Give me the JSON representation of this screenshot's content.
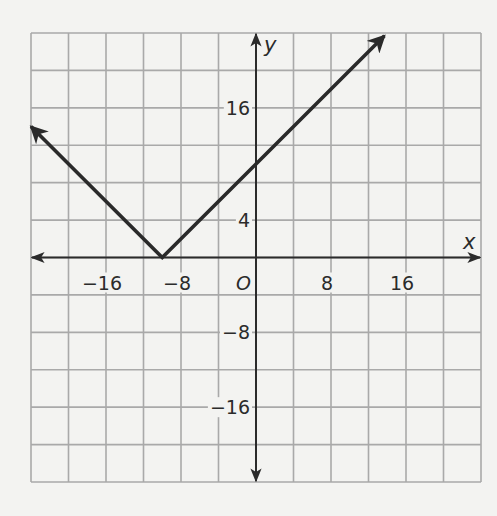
{
  "chart_data": {
    "type": "line",
    "title": "",
    "xlabel": "x",
    "ylabel": "y",
    "origin_label": "O",
    "xlim": [
      -24,
      24
    ],
    "ylim": [
      -24,
      24
    ],
    "grid": true,
    "grid_step": 4,
    "x_ticks": [
      {
        "value": -16,
        "label": "−16"
      },
      {
        "value": -8,
        "label": "−8"
      },
      {
        "value": 8,
        "label": "8"
      },
      {
        "value": 16,
        "label": "16"
      }
    ],
    "y_ticks": [
      {
        "value": 16,
        "label": "16"
      },
      {
        "value": 4,
        "label": "4"
      },
      {
        "value": -8,
        "label": "−8"
      },
      {
        "value": -16,
        "label": "−16"
      }
    ],
    "series": [
      {
        "name": "y = |x + 10|",
        "points": [
          {
            "x": -24,
            "y": 14
          },
          {
            "x": -10,
            "y": 0
          },
          {
            "x": 0,
            "y": 10
          },
          {
            "x": 13.7,
            "y": 23.7
          }
        ],
        "arrows": [
          "start",
          "end"
        ],
        "color": "#2a2a2a"
      }
    ],
    "vertex": {
      "x": -10,
      "y": 0
    },
    "y_intercept": {
      "x": 0,
      "y": 10
    }
  },
  "colors": {
    "background": "#f3f3f1",
    "grid": "#a9a9a9",
    "axis": "#2b2b2b",
    "line": "#2a2a2a"
  }
}
